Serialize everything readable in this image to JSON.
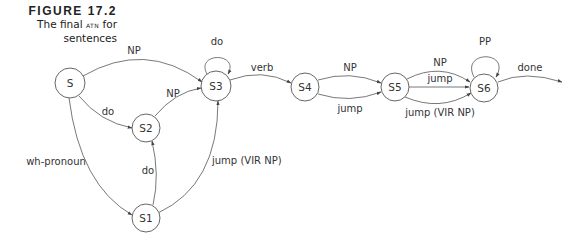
{
  "caption": {
    "figure_label": "FIGURE 17.2",
    "line1_prefix": "The final ",
    "line1_smallcaps": "atn",
    "line1_suffix": " for",
    "line2": "sentences"
  },
  "diagram": {
    "nodes": [
      {
        "id": "S",
        "label": "S"
      },
      {
        "id": "S1",
        "label": "S1"
      },
      {
        "id": "S2",
        "label": "S2"
      },
      {
        "id": "S3",
        "label": "S3"
      },
      {
        "id": "S4",
        "label": "S4"
      },
      {
        "id": "S5",
        "label": "S5"
      },
      {
        "id": "S6",
        "label": "S6"
      }
    ],
    "edges": [
      {
        "from": "S",
        "to": "S3",
        "label": "NP"
      },
      {
        "from": "S",
        "to": "S2",
        "label": "do"
      },
      {
        "from": "S",
        "to": "S1",
        "label": "wh-pronoun"
      },
      {
        "from": "S2",
        "to": "S3",
        "label": "NP"
      },
      {
        "from": "S1",
        "to": "S2",
        "label": "do"
      },
      {
        "from": "S1",
        "to": "S3",
        "label": "jump (VIR NP)"
      },
      {
        "from": "S3",
        "to": "S3",
        "label": "do"
      },
      {
        "from": "S3",
        "to": "S4",
        "label": "verb"
      },
      {
        "from": "S4",
        "to": "S5",
        "label": "NP"
      },
      {
        "from": "S4",
        "to": "S5",
        "label": "jump"
      },
      {
        "from": "S5",
        "to": "S6",
        "label": "NP"
      },
      {
        "from": "S5",
        "to": "S6",
        "label": "jump"
      },
      {
        "from": "S5",
        "to": "S6",
        "label": "jump (VIR NP)"
      },
      {
        "from": "S6",
        "to": "S6",
        "label": "PP"
      },
      {
        "from": "S6",
        "to": "end",
        "label": "done"
      }
    ]
  }
}
